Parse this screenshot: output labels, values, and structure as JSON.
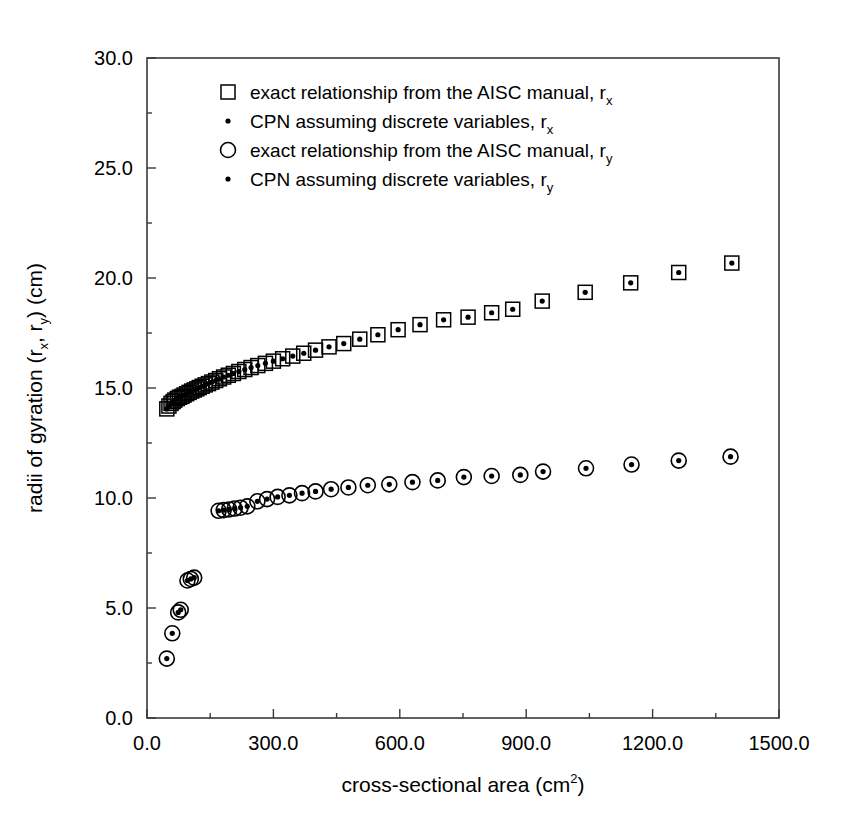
{
  "chart_data": {
    "type": "scatter",
    "title": "",
    "xlabel": "cross-sectional area (cm2)",
    "xlabel_base": "cross-sectional area (cm",
    "xlabel_sup": "2",
    "xlabel_tail": ")",
    "ylabel_base": "radii of gyration (r",
    "ylabel_sub1": "x",
    "ylabel_mid": ", r",
    "ylabel_sub2": "y",
    "ylabel_tail": ") (cm)",
    "ylabel": "radii of gyration (rx, ry) (cm)",
    "xlim": [
      0.0,
      1500.0
    ],
    "ylim": [
      0.0,
      30.0
    ],
    "xticks": [
      0.0,
      300.0,
      600.0,
      900.0,
      1200.0,
      1500.0
    ],
    "xtick_labels": [
      "0.0",
      "300.0",
      "600.0",
      "900.0",
      "1200.0",
      "1500.0"
    ],
    "yticks": [
      0.0,
      5.0,
      10.0,
      15.0,
      20.0,
      25.0,
      30.0
    ],
    "ytick_labels": [
      "0.0",
      "5.0",
      "10.0",
      "15.0",
      "20.0",
      "25.0",
      "30.0"
    ],
    "x_minor_step": 150.0,
    "y_minor_step": 2.5,
    "grid": false,
    "legend_position": "upper-center",
    "series": [
      {
        "name": "exact relationship from the AISC manual, rx",
        "label_base": "exact relationship from the AISC manual, r",
        "label_sub": "x",
        "marker": "open-square",
        "color": "#000000",
        "points": [
          [
            47,
            14.05
          ],
          [
            52,
            14.18
          ],
          [
            57,
            14.3
          ],
          [
            62,
            14.38
          ],
          [
            66,
            14.45
          ],
          [
            72,
            14.52
          ],
          [
            77,
            14.58
          ],
          [
            83,
            14.62
          ],
          [
            88,
            14.68
          ],
          [
            94,
            14.74
          ],
          [
            100,
            14.8
          ],
          [
            106,
            14.86
          ],
          [
            112,
            14.91
          ],
          [
            118,
            14.96
          ],
          [
            124,
            15.02
          ],
          [
            131,
            15.08
          ],
          [
            138,
            15.14
          ],
          [
            146,
            15.2
          ],
          [
            154,
            15.27
          ],
          [
            163,
            15.34
          ],
          [
            172,
            15.42
          ],
          [
            182,
            15.5
          ],
          [
            193,
            15.58
          ],
          [
            205,
            15.66
          ],
          [
            218,
            15.75
          ],
          [
            232,
            15.84
          ],
          [
            247,
            15.93
          ],
          [
            263,
            16.02
          ],
          [
            281,
            16.12
          ],
          [
            300,
            16.22
          ],
          [
            322,
            16.33
          ],
          [
            346,
            16.45
          ],
          [
            372,
            16.58
          ],
          [
            400,
            16.72
          ],
          [
            432,
            16.87
          ],
          [
            467,
            17.02
          ],
          [
            505,
            17.22
          ],
          [
            548,
            17.42
          ],
          [
            596,
            17.65
          ],
          [
            648,
            17.88
          ],
          [
            704,
            18.1
          ],
          [
            762,
            18.22
          ],
          [
            818,
            18.42
          ],
          [
            868,
            18.58
          ],
          [
            938,
            18.95
          ],
          [
            1040,
            19.35
          ],
          [
            1148,
            19.78
          ],
          [
            1262,
            20.25
          ],
          [
            1388,
            20.68
          ]
        ]
      },
      {
        "name": "CPN assuming discrete variables, rx",
        "label_base": "CPN assuming discrete variables, r",
        "label_sub": "x",
        "marker": "dot",
        "color": "#000000",
        "points": [
          [
            47,
            14.05
          ],
          [
            52,
            14.18
          ],
          [
            57,
            14.3
          ],
          [
            62,
            14.38
          ],
          [
            66,
            14.45
          ],
          [
            72,
            14.52
          ],
          [
            77,
            14.58
          ],
          [
            83,
            14.62
          ],
          [
            88,
            14.68
          ],
          [
            94,
            14.74
          ],
          [
            100,
            14.8
          ],
          [
            106,
            14.86
          ],
          [
            112,
            14.91
          ],
          [
            118,
            14.96
          ],
          [
            124,
            15.02
          ],
          [
            131,
            15.08
          ],
          [
            138,
            15.14
          ],
          [
            146,
            15.2
          ],
          [
            154,
            15.27
          ],
          [
            163,
            15.34
          ],
          [
            172,
            15.42
          ],
          [
            182,
            15.5
          ],
          [
            193,
            15.58
          ],
          [
            205,
            15.66
          ],
          [
            218,
            15.75
          ],
          [
            232,
            15.84
          ],
          [
            247,
            15.93
          ],
          [
            263,
            16.02
          ],
          [
            281,
            16.12
          ],
          [
            300,
            16.22
          ],
          [
            322,
            16.33
          ],
          [
            346,
            16.45
          ],
          [
            372,
            16.58
          ],
          [
            400,
            16.72
          ],
          [
            432,
            16.87
          ],
          [
            467,
            17.02
          ],
          [
            505,
            17.22
          ],
          [
            548,
            17.42
          ],
          [
            596,
            17.65
          ],
          [
            648,
            17.88
          ],
          [
            704,
            18.1
          ],
          [
            762,
            18.22
          ],
          [
            818,
            18.42
          ],
          [
            868,
            18.58
          ],
          [
            938,
            18.95
          ],
          [
            1040,
            19.35
          ],
          [
            1148,
            19.78
          ],
          [
            1262,
            20.25
          ],
          [
            1388,
            20.68
          ]
        ]
      },
      {
        "name": "exact relationship from the AISC manual, ry",
        "label_base": "exact relationship from the AISC manual, r",
        "label_sub": "y",
        "marker": "open-circle",
        "color": "#000000",
        "points": [
          [
            47,
            2.7
          ],
          [
            60,
            3.85
          ],
          [
            74,
            4.8
          ],
          [
            80,
            4.92
          ],
          [
            96,
            6.25
          ],
          [
            104,
            6.32
          ],
          [
            112,
            6.38
          ],
          [
            170,
            9.42
          ],
          [
            182,
            9.45
          ],
          [
            195,
            9.48
          ],
          [
            208,
            9.52
          ],
          [
            222,
            9.56
          ],
          [
            238,
            9.62
          ],
          [
            262,
            9.85
          ],
          [
            285,
            9.95
          ],
          [
            310,
            10.05
          ],
          [
            338,
            10.12
          ],
          [
            368,
            10.22
          ],
          [
            400,
            10.3
          ],
          [
            437,
            10.4
          ],
          [
            478,
            10.48
          ],
          [
            524,
            10.58
          ],
          [
            575,
            10.62
          ],
          [
            630,
            10.72
          ],
          [
            690,
            10.8
          ],
          [
            752,
            10.95
          ],
          [
            818,
            11.0
          ],
          [
            886,
            11.05
          ],
          [
            940,
            11.2
          ],
          [
            1042,
            11.35
          ],
          [
            1150,
            11.52
          ],
          [
            1262,
            11.7
          ],
          [
            1385,
            11.88
          ]
        ]
      },
      {
        "name": "CPN assuming discrete variables, ry",
        "label_base": "CPN assuming discrete variables, r",
        "label_sub": "y",
        "marker": "dot",
        "color": "#000000",
        "points": [
          [
            47,
            2.7
          ],
          [
            60,
            3.85
          ],
          [
            74,
            4.8
          ],
          [
            80,
            4.92
          ],
          [
            96,
            6.25
          ],
          [
            104,
            6.32
          ],
          [
            112,
            6.38
          ],
          [
            170,
            9.42
          ],
          [
            182,
            9.45
          ],
          [
            195,
            9.48
          ],
          [
            208,
            9.52
          ],
          [
            222,
            9.56
          ],
          [
            238,
            9.62
          ],
          [
            262,
            9.85
          ],
          [
            285,
            9.95
          ],
          [
            310,
            10.05
          ],
          [
            338,
            10.12
          ],
          [
            368,
            10.22
          ],
          [
            400,
            10.3
          ],
          [
            437,
            10.4
          ],
          [
            478,
            10.48
          ],
          [
            524,
            10.58
          ],
          [
            575,
            10.62
          ],
          [
            630,
            10.72
          ],
          [
            690,
            10.8
          ],
          [
            752,
            10.95
          ],
          [
            818,
            11.0
          ],
          [
            886,
            11.05
          ],
          [
            940,
            11.2
          ],
          [
            1042,
            11.35
          ],
          [
            1150,
            11.52
          ],
          [
            1262,
            11.7
          ],
          [
            1385,
            11.88
          ]
        ]
      }
    ]
  },
  "figure": {
    "background": "#ffffff",
    "frame_color": "#3a3a3a",
    "marker_color": "#000000"
  }
}
